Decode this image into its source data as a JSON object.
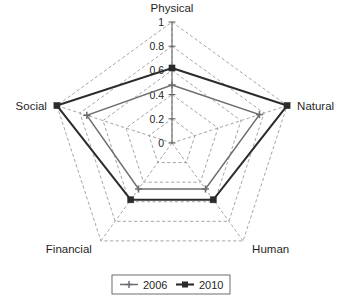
{
  "chart_data": {
    "type": "radar",
    "title": "",
    "categories": [
      "Physical",
      "Natural",
      "Human",
      "Financial",
      "Social"
    ],
    "axis_labels": {
      "physical": "Physical",
      "natural": "Natural",
      "human": "Human",
      "financial": "Financial",
      "social": "Social"
    },
    "tick_labels": [
      "1",
      "0.8",
      "0.6",
      "0.4",
      "0.2",
      "0"
    ],
    "tick_values": [
      1,
      0.8,
      0.6,
      0.4,
      0.2,
      0
    ],
    "radial_range": [
      0,
      1
    ],
    "rings": 5,
    "grid": true,
    "legend_position": "bottom",
    "series": [
      {
        "name": "2006",
        "color": "#6e6e6e",
        "marker": "plus",
        "values": [
          0.48,
          0.76,
          0.47,
          0.47,
          0.74
        ]
      },
      {
        "name": "2010",
        "color": "#2b2b2b",
        "marker": "square",
        "values": [
          0.62,
          1.0,
          0.58,
          0.58,
          1.0
        ]
      }
    ]
  },
  "legend": {
    "entries": [
      {
        "label": "2006"
      },
      {
        "label": "2010"
      }
    ]
  }
}
